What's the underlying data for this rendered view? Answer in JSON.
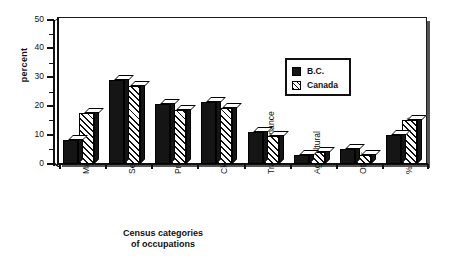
{
  "chart_data": {
    "type": "bar",
    "title": "",
    "xlabel": "Census categories of occupations",
    "ylabel": "percent",
    "ylim": [
      0,
      50
    ],
    "yticks": [
      0,
      10,
      20,
      30,
      40,
      50
    ],
    "yticks_minor": [
      5,
      15,
      25,
      35,
      45
    ],
    "grid": false,
    "legend_position": "upper-right",
    "style": "3d-bars",
    "categories": [
      "Manufacturing",
      "Service",
      "Professional",
      "Clerical",
      "Trades&Finance",
      "Agricultural",
      "Other",
      "% of  workforce"
    ],
    "series": [
      {
        "name": "B.C.",
        "values": [
          8.3,
          29.0,
          20.5,
          21.5,
          11.0,
          3.0,
          5.0,
          10.0
        ],
        "color": "#151515",
        "fill": "solid"
      },
      {
        "name": "Canada",
        "values": [
          17.7,
          27.0,
          18.7,
          19.4,
          9.4,
          4.0,
          3.0,
          15.0
        ],
        "color": "#111111",
        "fill": "hatched"
      }
    ]
  },
  "axis": {
    "y_title": "percent",
    "x_title_line1": "Census categories",
    "x_title_line2": "of occupations",
    "y_labels": [
      "50",
      "40",
      "30",
      "20",
      "10",
      "0"
    ]
  },
  "legend": {
    "items": [
      {
        "label": "B.C.",
        "icon": "solid-square-swatch"
      },
      {
        "label": "Canada",
        "icon": "hatched-square-swatch"
      }
    ]
  }
}
